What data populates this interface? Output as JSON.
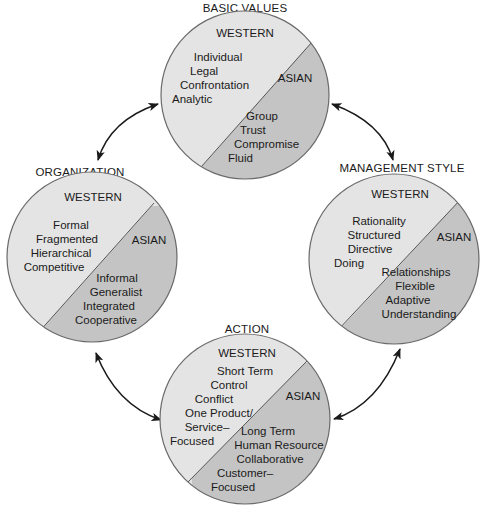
{
  "colors": {
    "western_fill": "#e4e4e4",
    "asian_fill": "#c4c4c4",
    "outline": "#6a6a6a",
    "text": "#1a1a1a",
    "arrow": "#1a1a1a"
  },
  "circles": [
    {
      "id": "basic-values",
      "title": "BASIC VALUES",
      "western": {
        "header": "WESTERN",
        "items": [
          "Individual",
          "Legal",
          "Confrontation",
          "Analytic"
        ]
      },
      "asian": {
        "header": "ASIAN",
        "items": [
          "Group",
          "Trust",
          "Compromise",
          "Fluid"
        ]
      }
    },
    {
      "id": "organization",
      "title": "ORGANIZATION",
      "western": {
        "header": "WESTERN",
        "items": [
          "Formal",
          "Fragmented",
          "Hierarchical",
          "Competitive"
        ]
      },
      "asian": {
        "header": "ASIAN",
        "items": [
          "Informal",
          "Generalist",
          "Integrated",
          "Cooperative"
        ]
      }
    },
    {
      "id": "management-style",
      "title": "MANAGEMENT STYLE",
      "western": {
        "header": "WESTERN",
        "items": [
          "Rationality",
          "Structured",
          "Directive",
          "Doing"
        ]
      },
      "asian": {
        "header": "ASIAN",
        "items": [
          "Relationships",
          "Flexible",
          "Adaptive",
          "Understanding"
        ]
      }
    },
    {
      "id": "action",
      "title": "ACTION",
      "western": {
        "header": "WESTERN",
        "items": [
          "Short Term",
          "Control",
          "Conflict",
          "One Product/",
          "Service–",
          "Focused"
        ]
      },
      "asian": {
        "header": "ASIAN",
        "items": [
          "Long Term",
          "Human Resource",
          "Collaborative",
          "Customer–",
          "Focused"
        ]
      }
    }
  ],
  "connections": [
    {
      "from": "basic-values",
      "to": "organization",
      "bidirectional": true
    },
    {
      "from": "basic-values",
      "to": "management-style",
      "bidirectional": true
    },
    {
      "from": "organization",
      "to": "action",
      "bidirectional": true
    },
    {
      "from": "management-style",
      "to": "action",
      "bidirectional": true
    }
  ]
}
